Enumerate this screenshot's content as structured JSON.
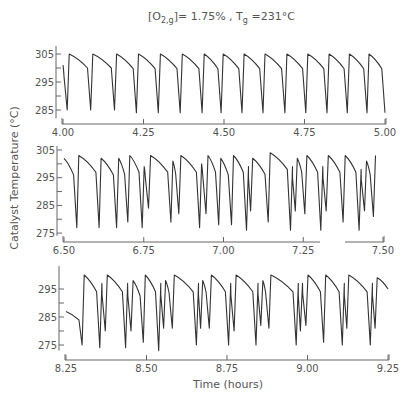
{
  "chart_data": {
    "type": "line",
    "title_parts": {
      "bracket_open": "[O",
      "sub1": "2,g",
      "bracket_close": "]",
      "eq1": "= 1.75% , T",
      "sub2": "g",
      "eq2": " =231°C"
    },
    "ylabel": "Catalyst Temperature (°C)",
    "xlabel": "Time (hours)",
    "grid": false,
    "legend": null,
    "panels": [
      {
        "id": "panel-1",
        "xlim": [
          4.0,
          5.0
        ],
        "ylim": [
          282,
          308
        ],
        "xticks": [
          4.0,
          4.25,
          4.5,
          4.75,
          5.0
        ],
        "xtick_labels": [
          "4.00",
          "4.25",
          "4.50",
          "4.75",
          "5.00"
        ],
        "yticks": [
          285,
          290,
          295,
          300,
          305
        ],
        "ytick_labels": [
          "285",
          "",
          "295",
          "",
          "305"
        ],
        "start_value": 301,
        "pattern": "regular relaxation oscillations: sharp drop to ~285 °C then rapid rise to ~305 °C and slow decay",
        "events": [
          {
            "t": 4.013,
            "min": 285,
            "peak": 305
          },
          {
            "t": 4.086,
            "min": 285,
            "peak": 305
          },
          {
            "t": 4.16,
            "min": 285,
            "peak": 305
          },
          {
            "t": 4.228,
            "min": 284,
            "peak": 305
          },
          {
            "t": 4.296,
            "min": 284,
            "peak": 305
          },
          {
            "t": 4.364,
            "min": 284,
            "peak": 305
          },
          {
            "t": 4.432,
            "min": 284,
            "peak": 305
          },
          {
            "t": 4.491,
            "min": 284,
            "peak": 305
          },
          {
            "t": 4.556,
            "min": 284,
            "peak": 305
          },
          {
            "t": 4.621,
            "min": 284,
            "peak": 305
          },
          {
            "t": 4.689,
            "min": 284,
            "peak": 305
          },
          {
            "t": 4.754,
            "min": 284,
            "peak": 305
          },
          {
            "t": 4.82,
            "min": 284,
            "peak": 305
          },
          {
            "t": 4.883,
            "min": 284,
            "peak": 305
          },
          {
            "t": 4.944,
            "min": 284,
            "peak": 305
          },
          {
            "t": 5.0,
            "min": 284,
            "peak": null
          }
        ]
      },
      {
        "id": "panel-2",
        "xlim": [
          6.5,
          7.5
        ],
        "ylim": [
          274,
          306
        ],
        "xticks": [
          6.5,
          6.75,
          7.0,
          7.25,
          7.5
        ],
        "xtick_labels": [
          "6.50",
          "6.75",
          "7.00",
          "7.25",
          "7.50"
        ],
        "yticks": [
          275,
          280,
          285,
          290,
          295,
          300,
          305
        ],
        "ytick_labels": [
          "275",
          "",
          "285",
          "",
          "295",
          "",
          "305"
        ],
        "start_value": 302,
        "pattern": "mixed-mode oscillations: large drops to ~277 °C interleaved with smaller secondary drops to ~282–286 °C",
        "events": [
          {
            "t": 6.54,
            "min": 277,
            "peak": 303
          },
          {
            "t": 6.61,
            "min": 277,
            "peak": 302
          },
          {
            "t": 6.665,
            "min": 277,
            "peak": 302
          },
          {
            "t": 6.7,
            "min": 279,
            "peak": 303
          },
          {
            "t": 6.745,
            "min": 277,
            "peak": 299
          },
          {
            "t": 6.765,
            "min": 284,
            "peak": 303
          },
          {
            "t": 6.835,
            "min": 279,
            "peak": 301
          },
          {
            "t": 6.86,
            "min": 282,
            "peak": 303
          },
          {
            "t": 6.925,
            "min": 277,
            "peak": 300
          },
          {
            "t": 6.945,
            "min": 282,
            "peak": 303
          },
          {
            "t": 6.985,
            "min": 278,
            "peak": 302
          },
          {
            "t": 7.025,
            "min": 278,
            "peak": 303
          },
          {
            "t": 7.072,
            "min": 276,
            "peak": 299
          },
          {
            "t": 7.085,
            "min": 283,
            "peak": 302
          },
          {
            "t": 7.14,
            "min": 279,
            "peak": 304
          },
          {
            "t": 7.21,
            "min": 276,
            "peak": 299
          },
          {
            "t": 7.225,
            "min": 283,
            "peak": 302
          },
          {
            "t": 7.255,
            "min": 282,
            "peak": 303
          },
          {
            "t": 7.305,
            "min": 276,
            "peak": 299
          },
          {
            "t": 7.322,
            "min": 283,
            "peak": 303
          },
          {
            "t": 7.375,
            "min": 279,
            "peak": 303
          },
          {
            "t": 7.425,
            "min": 276,
            "peak": 298
          },
          {
            "t": 7.442,
            "min": 283,
            "peak": 301
          },
          {
            "t": 7.47,
            "min": 281,
            "peak": 303
          }
        ]
      },
      {
        "id": "panel-3",
        "xlim": [
          8.25,
          9.25
        ],
        "ylim": [
          273,
          300
        ],
        "xticks": [
          8.25,
          8.5,
          8.75,
          9.0,
          9.25
        ],
        "xtick_labels": [
          "8.25",
          "8.50",
          "8.75",
          "9.00",
          "9.25"
        ],
        "yticks": [
          275,
          280,
          285,
          290,
          295
        ],
        "ytick_labels": [
          "275",
          "",
          "285",
          "",
          "295"
        ],
        "start_value": 287,
        "pattern": "mixed-mode oscillations with deep drops to ~275 °C and secondary drops to ~280–282 °C",
        "events": [
          {
            "t": 8.3,
            "min": 275,
            "peak": 300
          },
          {
            "t": 8.355,
            "min": 274,
            "peak": 297
          },
          {
            "t": 8.372,
            "min": 280,
            "peak": 300
          },
          {
            "t": 8.435,
            "min": 274,
            "peak": 297
          },
          {
            "t": 8.452,
            "min": 280,
            "peak": 298
          },
          {
            "t": 8.49,
            "min": 276,
            "peak": 300
          },
          {
            "t": 8.538,
            "min": 273,
            "peak": 297
          },
          {
            "t": 8.553,
            "min": 281,
            "peak": 298
          },
          {
            "t": 8.58,
            "min": 281,
            "peak": 300
          },
          {
            "t": 8.655,
            "min": 275,
            "peak": 297
          },
          {
            "t": 8.668,
            "min": 281,
            "peak": 298
          },
          {
            "t": 8.695,
            "min": 281,
            "peak": 300
          },
          {
            "t": 8.755,
            "min": 275,
            "peak": 297
          },
          {
            "t": 8.772,
            "min": 280,
            "peak": 300
          },
          {
            "t": 8.84,
            "min": 275,
            "peak": 297
          },
          {
            "t": 8.855,
            "min": 282,
            "peak": 298
          },
          {
            "t": 8.88,
            "min": 281,
            "peak": 300
          },
          {
            "t": 8.965,
            "min": 275,
            "peak": 297
          },
          {
            "t": 8.978,
            "min": 280,
            "peak": 297
          },
          {
            "t": 8.995,
            "min": 282,
            "peak": 300
          },
          {
            "t": 9.05,
            "min": 276,
            "peak": 300
          },
          {
            "t": 9.108,
            "min": 275,
            "peak": 297
          },
          {
            "t": 9.122,
            "min": 281,
            "peak": 300
          },
          {
            "t": 9.195,
            "min": 275,
            "peak": 297
          },
          {
            "t": 9.21,
            "min": 281,
            "peak": 299
          }
        ],
        "end_value": 295
      }
    ]
  },
  "layout": {
    "panels": [
      {
        "axis_x": 56,
        "baseline_y": 124,
        "x0": 63,
        "x1": 385,
        "ref_temp": 305,
        "ref_y": 54,
        "px_per_deg": 2.8,
        "top_y": 46
      },
      {
        "axis_x": 57,
        "baseline_y": 242,
        "x0": 64,
        "x1": 383,
        "ref_temp": 305,
        "ref_y": 150,
        "px_per_deg": 2.77,
        "top_y": 146,
        "axis_gap": [
          320,
          345
        ]
      },
      {
        "axis_x": 59,
        "baseline_y": 360,
        "x0": 66,
        "x1": 388,
        "ref_temp": 295,
        "ref_y": 289,
        "px_per_deg": 2.8,
        "top_y": 266
      }
    ]
  }
}
